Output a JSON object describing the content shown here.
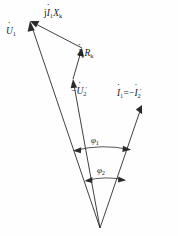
{
  "figure": {
    "kind": "phasor-diagram",
    "title": "",
    "background_color": "#fefefe",
    "line_color": "#2b2b2b",
    "width": 178,
    "height": 236
  },
  "labels": {
    "j_i1_xk": {
      "id": "jI1Xk",
      "prefix": "j",
      "current": "I",
      "current_sub": "1",
      "reactance": "X",
      "reactance_sub": "k",
      "dot_over_current": true
    },
    "u1": {
      "id": "U1",
      "symbol": "U",
      "sub": "1",
      "dot_over": true
    },
    "i1_rk": {
      "id": "I1Rk",
      "current": "I",
      "current_sub": "1",
      "resistance": "R",
      "resistance_sub": "k",
      "dot_over_current": true
    },
    "neg_u2_prime": {
      "id": "-U2'",
      "sign": "−",
      "symbol": "U",
      "sub": "2",
      "prime": "′",
      "dot_over": true
    },
    "i1_eq_neg_i2_prime": {
      "id": "I1 = -I2'",
      "left_symbol": "I",
      "left_sub": "1",
      "equals": "=",
      "sign": "−",
      "right_symbol": "I",
      "right_sub": "2",
      "right_prime": "′",
      "dot_over": true
    },
    "phi1": {
      "id": "phi1",
      "symbol": "φ",
      "sub": "1"
    },
    "phi2": {
      "id": "phi2",
      "symbol": "φ",
      "sub": "2"
    }
  },
  "geometry": {
    "origin": {
      "x": 100,
      "y": 228
    },
    "vertices": {
      "u1_tip": {
        "x": 30,
        "y": 21
      },
      "irk_start_xk_joint": {
        "x": 82,
        "y": 48
      },
      "u2_tip": {
        "x": 73,
        "y": 79
      },
      "i1_tip": {
        "x": 142,
        "y": 105
      }
    },
    "vectors": [
      {
        "name": "U1",
        "from": "origin",
        "to": "u1_tip",
        "arrow_at": "to"
      },
      {
        "name": "-U2'",
        "from": "origin",
        "to": "u2_tip",
        "arrow_at": "to"
      },
      {
        "name": "I1Rk",
        "from": "u2_tip",
        "to": "irk_start_xk_joint",
        "arrow_at": "to"
      },
      {
        "name": "jI1Xk",
        "from": "irk_start_xk_joint",
        "to": "u1_tip",
        "arrow_at": "to"
      },
      {
        "name": "I1",
        "from": "origin",
        "to": "i1_tip",
        "arrow_at": "to"
      }
    ],
    "arcs": [
      {
        "name": "phi1",
        "radius": 88,
        "between": [
          "U1",
          "I1"
        ],
        "double_arrow": true
      },
      {
        "name": "phi2",
        "radius": 56,
        "between": [
          "-U2'",
          "I1"
        ],
        "double_arrow": true
      }
    ]
  }
}
